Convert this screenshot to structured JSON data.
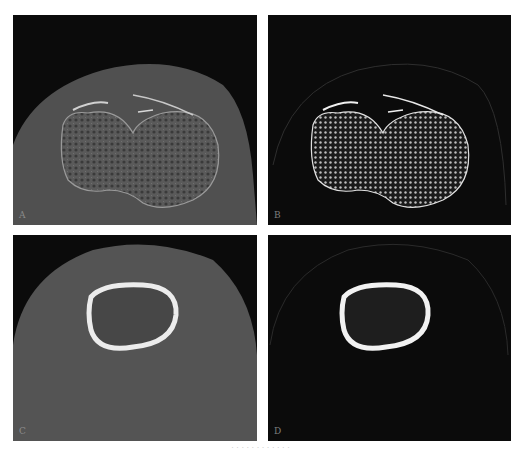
{
  "figure": {
    "panels": [
      {
        "id": "A",
        "label": "A",
        "description": "CT axial slice, knee/femoral condyles, soft tissue window"
      },
      {
        "id": "B",
        "label": "B",
        "description": "CT axial slice, knee/femoral condyles, bone window"
      },
      {
        "id": "C",
        "label": "C",
        "description": "CT axial slice, femoral shaft, soft tissue window"
      },
      {
        "id": "D",
        "label": "D",
        "description": "CT axial slice, femoral shaft, bone window"
      }
    ],
    "caption": "· · · · · · · · · · · ·"
  },
  "colors": {
    "background": "#ffffff",
    "panel_bg": "#0b0b0b",
    "soft_tissue": "#4e4e4e",
    "bone": "#e8e8e8"
  }
}
